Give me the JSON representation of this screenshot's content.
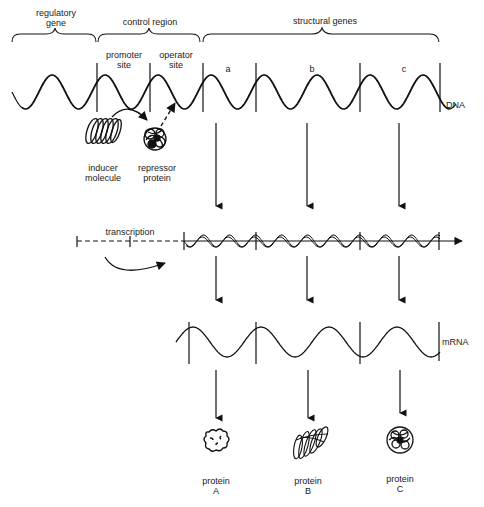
{
  "diagram": {
    "top_labels": {
      "regulatory_gene": [
        "regulatory",
        "gene"
      ],
      "control_region": "control region",
      "structural_genes": "structural genes"
    },
    "sites": {
      "promoter": [
        "promoter",
        "site"
      ],
      "operator": [
        "operator",
        "site"
      ]
    },
    "gene_letters": [
      "a",
      "b",
      "c"
    ],
    "dna_label": "DNA",
    "molecules": {
      "inducer": [
        "inducer",
        "molecule"
      ],
      "repressor": [
        "repressor",
        "protein"
      ]
    },
    "transcription_label": "transcription",
    "mrna_label": "mRNA",
    "proteins": [
      {
        "line1": "protein",
        "line2": "A"
      },
      {
        "line1": "protein",
        "line2": "B"
      },
      {
        "line1": "protein",
        "line2": "C"
      }
    ],
    "stroke_color": "#111111",
    "background": "#ffffff"
  }
}
